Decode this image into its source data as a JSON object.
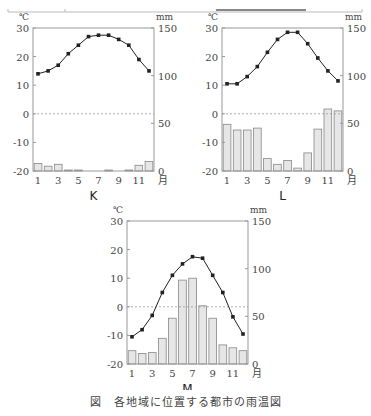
{
  "figure_caption": "図　各地域に位置する都市の雨温図",
  "axes": {
    "temp_unit": "℃",
    "precip_unit": "mm",
    "month_unit": "月",
    "temp_ticks": [
      30,
      20,
      10,
      0,
      -10,
      -20
    ],
    "precip_ticks": [
      150,
      100,
      50,
      0
    ],
    "month_ticks": [
      1,
      3,
      5,
      7,
      9,
      11
    ]
  },
  "colors": {
    "line": "#222222",
    "bar_fill": "#e6e6e6",
    "bar_stroke": "#888888",
    "frame": "#999999",
    "zero_line": "#999999"
  },
  "chart_data": [
    {
      "type": "bar+line",
      "title": "K",
      "xlabel": "月",
      "ylabel_left": "℃",
      "ylabel_right": "mm",
      "categories": [
        1,
        2,
        3,
        4,
        5,
        6,
        7,
        8,
        9,
        10,
        11,
        12
      ],
      "ylim_temp": [
        -20,
        30
      ],
      "ylim_precip": [
        0,
        150
      ],
      "series": [
        {
          "name": "temperature",
          "axis": "left",
          "kind": "line",
          "values": [
            14,
            15,
            17,
            21,
            24,
            27,
            27.5,
            27.5,
            26,
            24,
            19,
            15
          ]
        },
        {
          "name": "precipitation",
          "axis": "right",
          "kind": "bar",
          "values": [
            8,
            5,
            7,
            1,
            1,
            0,
            0,
            1,
            0,
            1,
            6,
            10
          ]
        }
      ],
      "grid": false,
      "zero_line_dashed": true
    },
    {
      "type": "bar+line",
      "title": "L",
      "xlabel": "月",
      "ylabel_left": "℃",
      "ylabel_right": "mm",
      "categories": [
        1,
        2,
        3,
        4,
        5,
        6,
        7,
        8,
        9,
        10,
        11,
        12
      ],
      "ylim_temp": [
        -20,
        30
      ],
      "ylim_precip": [
        0,
        150
      ],
      "series": [
        {
          "name": "temperature",
          "axis": "left",
          "kind": "line",
          "values": [
            10.5,
            10.5,
            13,
            16.5,
            21.5,
            26,
            28.5,
            28.5,
            24.5,
            19.5,
            15,
            11.5
          ]
        },
        {
          "name": "precipitation",
          "axis": "right",
          "kind": "bar",
          "values": [
            49,
            43,
            43,
            45,
            13,
            7,
            11,
            3,
            19,
            44,
            65,
            63
          ]
        }
      ],
      "grid": false,
      "zero_line_dashed": true
    },
    {
      "type": "bar+line",
      "title": "M",
      "xlabel": "月",
      "ylabel_left": "℃",
      "ylabel_right": "mm",
      "categories": [
        1,
        2,
        3,
        4,
        5,
        6,
        7,
        8,
        9,
        10,
        11,
        12
      ],
      "ylim_temp": [
        -20,
        30
      ],
      "ylim_precip": [
        0,
        150
      ],
      "series": [
        {
          "name": "temperature",
          "axis": "left",
          "kind": "line",
          "values": [
            -10.5,
            -8,
            -3,
            5,
            11,
            15,
            17.5,
            17,
            11,
            5,
            -3.5,
            -9.5
          ]
        },
        {
          "name": "precipitation",
          "axis": "right",
          "kind": "bar",
          "values": [
            14,
            11,
            12,
            27,
            48,
            88,
            90,
            61,
            48,
            20,
            17,
            14
          ]
        }
      ],
      "grid": false,
      "zero_line_dashed": true
    }
  ]
}
